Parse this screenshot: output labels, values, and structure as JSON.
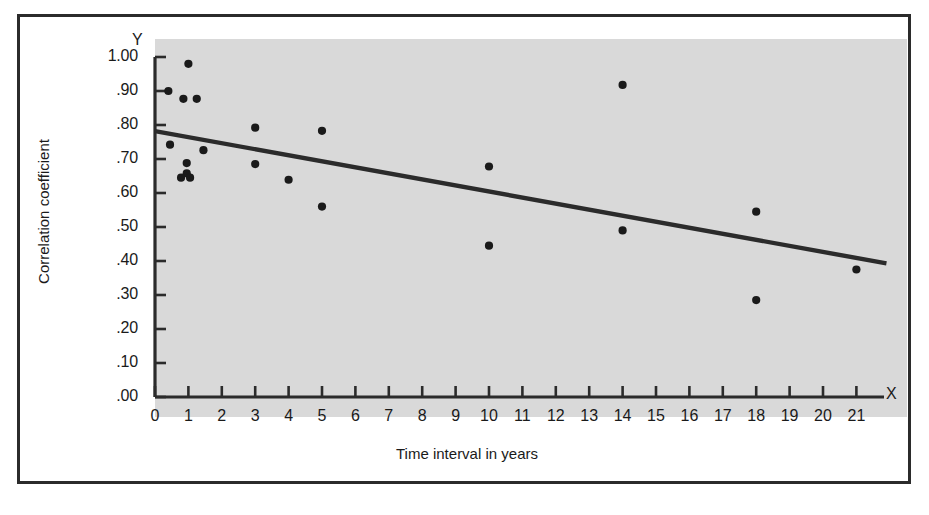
{
  "figure": {
    "axis_letter_y": "Y",
    "axis_letter_x": "X",
    "background_color": "#d9d9d9",
    "frame_color": "#2b2b2b"
  },
  "chart_data": {
    "type": "scatter",
    "title": "",
    "xlabel": "Time interval in years",
    "ylabel": "Correlation coefficient",
    "xlim": [
      0,
      21.8
    ],
    "ylim": [
      0.0,
      1.0
    ],
    "grid": false,
    "legend": null,
    "xticks": [
      "0",
      "1",
      "2",
      "3",
      "4",
      "5",
      "6",
      "7",
      "8",
      "9",
      "10",
      "11",
      "12",
      "13",
      "14",
      "15",
      "16",
      "17",
      "18",
      "19",
      "20",
      "21"
    ],
    "xtick_values": [
      0,
      1,
      2,
      3,
      4,
      5,
      6,
      7,
      8,
      9,
      10,
      11,
      12,
      13,
      14,
      15,
      16,
      17,
      18,
      19,
      20,
      21
    ],
    "yticks": [
      "1.00",
      ".90",
      ".80",
      ".70",
      ".60",
      ".50",
      ".40",
      ".30",
      ".20",
      ".10",
      ".00"
    ],
    "ytick_values": [
      1.0,
      0.9,
      0.8,
      0.7,
      0.6,
      0.5,
      0.4,
      0.3,
      0.2,
      0.1,
      0.0
    ],
    "point_color": "#1a1a1a",
    "line_color": "#2b2b2b",
    "points": [
      {
        "x": 1.0,
        "y": 0.98
      },
      {
        "x": 0.4,
        "y": 0.9
      },
      {
        "x": 0.85,
        "y": 0.877
      },
      {
        "x": 1.25,
        "y": 0.877
      },
      {
        "x": 0.45,
        "y": 0.742
      },
      {
        "x": 1.45,
        "y": 0.726
      },
      {
        "x": 0.95,
        "y": 0.688
      },
      {
        "x": 0.95,
        "y": 0.658
      },
      {
        "x": 0.78,
        "y": 0.645
      },
      {
        "x": 1.05,
        "y": 0.645
      },
      {
        "x": 3.0,
        "y": 0.792
      },
      {
        "x": 3.0,
        "y": 0.685
      },
      {
        "x": 4.0,
        "y": 0.639
      },
      {
        "x": 5.0,
        "y": 0.783
      },
      {
        "x": 5.0,
        "y": 0.56
      },
      {
        "x": 10.0,
        "y": 0.678
      },
      {
        "x": 10.0,
        "y": 0.445
      },
      {
        "x": 14.0,
        "y": 0.918
      },
      {
        "x": 14.0,
        "y": 0.49
      },
      {
        "x": 18.0,
        "y": 0.545
      },
      {
        "x": 18.0,
        "y": 0.285
      },
      {
        "x": 21.0,
        "y": 0.375
      }
    ],
    "trendline": {
      "type": "linear",
      "x_start": 0.0,
      "y_start": 0.782,
      "x_end": 21.9,
      "y_end": 0.393
    }
  }
}
